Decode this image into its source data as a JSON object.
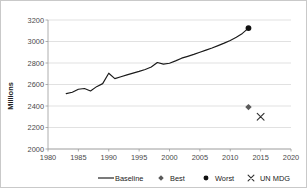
{
  "chart_data": {
    "type": "line",
    "title": "",
    "xlabel": "",
    "ylabel": "Millions",
    "xlim": [
      1980,
      2020
    ],
    "ylim": [
      2000,
      3200
    ],
    "xticks": [
      1980,
      1985,
      1990,
      1995,
      2000,
      2005,
      2010,
      2015,
      2020
    ],
    "yticks": [
      2000,
      2200,
      2400,
      2600,
      2800,
      3000,
      3200
    ],
    "grid": "horizontal",
    "legend_position": "bottom",
    "series": [
      {
        "name": "Baseline",
        "type": "line",
        "marker": "none",
        "color": "#1a1a1a",
        "x": [
          1983,
          1984,
          1985,
          1986,
          1987,
          1988,
          1989,
          1990,
          1991,
          1992,
          1993,
          1994,
          1995,
          1996,
          1997,
          1998,
          1999,
          2000,
          2001,
          2002,
          2003,
          2004,
          2005,
          2006,
          2007,
          2008,
          2009,
          2010,
          2011,
          2012,
          2013
        ],
        "values": [
          2515,
          2528,
          2556,
          2563,
          2540,
          2580,
          2608,
          2705,
          2655,
          2672,
          2690,
          2706,
          2722,
          2740,
          2762,
          2805,
          2790,
          2798,
          2820,
          2845,
          2862,
          2880,
          2900,
          2920,
          2940,
          2962,
          2985,
          3010,
          3040,
          3075,
          3125
        ]
      },
      {
        "name": "Best",
        "type": "scatter",
        "marker": "diamond",
        "color": "#5a5a5a",
        "x": [
          2013
        ],
        "values": [
          2390
        ]
      },
      {
        "name": "Worst",
        "type": "scatter",
        "marker": "circle",
        "color": "#111111",
        "x": [
          2013
        ],
        "values": [
          3125
        ]
      },
      {
        "name": "UN MDG",
        "type": "scatter",
        "marker": "x",
        "color": "#333333",
        "x": [
          2015
        ],
        "values": [
          2300
        ]
      }
    ]
  },
  "axis": {
    "y_title": "Millions",
    "y_labels": [
      "3200",
      "3000",
      "2800",
      "2600",
      "2400",
      "2200",
      "2000"
    ],
    "x_labels": [
      "1980",
      "1985",
      "1990",
      "1995",
      "2000",
      "2005",
      "2010",
      "2015",
      "2020"
    ]
  },
  "legend": {
    "items": [
      {
        "label": "Baseline",
        "marker": "line"
      },
      {
        "label": "Best",
        "marker": "diamond"
      },
      {
        "label": "Worst",
        "marker": "circle"
      },
      {
        "label": "UN MDG",
        "marker": "x"
      }
    ]
  },
  "colors": {
    "line": "#1a1a1a",
    "grid": "#d4d4d4",
    "axis": "#9a9a9a",
    "best_marker": "#5a5a5a",
    "worst_marker": "#111111",
    "mdg_marker": "#333333",
    "border": "#c9c9c9"
  }
}
